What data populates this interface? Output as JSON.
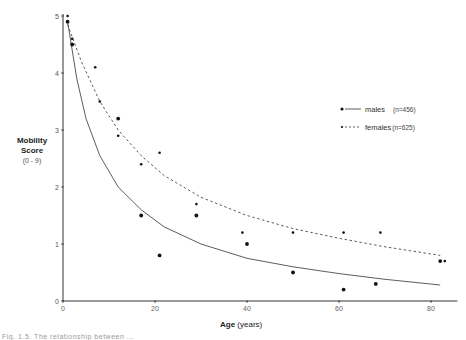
{
  "chart_data": {
    "type": "scatter",
    "title": "",
    "xlabel": "Age",
    "xlabel_unit": "(years)",
    "ylabel": "Mobility",
    "ylabel_line2": "Score",
    "ylabel_line3": "(0 - 9)",
    "xlim": [
      0,
      84
    ],
    "ylim": [
      0,
      5
    ],
    "x_ticks": [
      0,
      20,
      40,
      60,
      80
    ],
    "y_ticks": [
      0,
      1,
      2,
      3,
      4,
      5
    ],
    "grid": false,
    "legend_position": "upper right",
    "series": [
      {
        "name": "males",
        "n_label": "(n=456)",
        "marker": "large dot",
        "line_style": "solid",
        "points": [
          [
            1,
            4.9
          ],
          [
            2,
            4.5
          ],
          [
            12,
            3.2
          ],
          [
            17,
            1.5
          ],
          [
            21,
            0.8
          ],
          [
            29,
            1.5
          ],
          [
            40,
            1.0
          ],
          [
            50,
            0.5
          ],
          [
            61,
            0.2
          ],
          [
            68,
            0.3
          ],
          [
            82,
            0.7
          ]
        ],
        "fit_curve": [
          [
            1,
            4.9
          ],
          [
            3,
            3.9
          ],
          [
            5,
            3.2
          ],
          [
            8,
            2.55
          ],
          [
            12,
            2.0
          ],
          [
            17,
            1.6
          ],
          [
            22,
            1.3
          ],
          [
            30,
            1.0
          ],
          [
            40,
            0.75
          ],
          [
            50,
            0.6
          ],
          [
            60,
            0.48
          ],
          [
            70,
            0.38
          ],
          [
            82,
            0.28
          ]
        ]
      },
      {
        "name": "females",
        "n_label": "(n=625)",
        "marker": "small dot",
        "line_style": "dashed",
        "points": [
          [
            1,
            5.0
          ],
          [
            2,
            4.6
          ],
          [
            7,
            4.1
          ],
          [
            8,
            3.5
          ],
          [
            12,
            2.9
          ],
          [
            17,
            2.4
          ],
          [
            21,
            2.6
          ],
          [
            29,
            1.7
          ],
          [
            39,
            1.2
          ],
          [
            50,
            1.2
          ],
          [
            61,
            1.2
          ],
          [
            69,
            1.2
          ],
          [
            83,
            0.7
          ]
        ],
        "fit_curve": [
          [
            1,
            4.85
          ],
          [
            4,
            4.2
          ],
          [
            8,
            3.5
          ],
          [
            12,
            3.0
          ],
          [
            17,
            2.55
          ],
          [
            22,
            2.2
          ],
          [
            30,
            1.82
          ],
          [
            40,
            1.5
          ],
          [
            50,
            1.27
          ],
          [
            60,
            1.1
          ],
          [
            70,
            0.95
          ],
          [
            82,
            0.8
          ]
        ]
      }
    ]
  },
  "legend": {
    "males_label": "males",
    "males_n": "(n=456)",
    "females_label": "females",
    "females_n": "(n=625)"
  },
  "axes": {
    "xlabel": "Age",
    "xlabel_unit": "(years)",
    "ylabel_1": "Mobility",
    "ylabel_2": "Score",
    "ylabel_3": "(0 - 9)"
  },
  "caption": "Fig. 1.5.  The relationship between ..."
}
